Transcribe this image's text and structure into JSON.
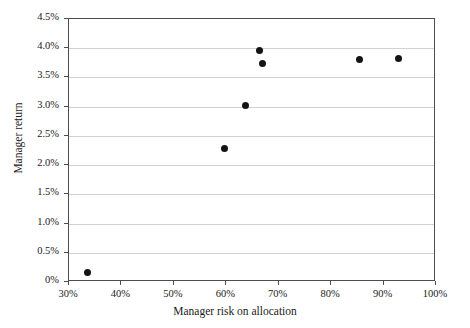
{
  "chart_data": {
    "type": "scatter",
    "title": "",
    "xlabel": "Manager risk on allocation",
    "ylabel": "Manager return",
    "xlim": [
      30,
      100
    ],
    "ylim": [
      0,
      4.5
    ],
    "xticks": [
      30,
      40,
      50,
      60,
      70,
      80,
      90,
      100
    ],
    "xtick_labels": [
      "30%",
      "40%",
      "50%",
      "60%",
      "70%",
      "80%",
      "90%",
      "100%"
    ],
    "yticks": [
      0,
      0.5,
      1.0,
      1.5,
      2.0,
      2.5,
      3.0,
      3.5,
      4.0,
      4.5
    ],
    "ytick_labels": [
      "0%",
      "0.5%",
      "1.0%",
      "1.5%",
      "2.0%",
      "2.5%",
      "3.0%",
      "3.5%",
      "4.0%",
      "4.5%"
    ],
    "grid": "horizontal",
    "legend": "none",
    "marker": {
      "shape": "circle",
      "color": "#141414",
      "size": 7
    },
    "points": [
      {
        "x": 33.6,
        "y": 0.17
      },
      {
        "x": 59.7,
        "y": 2.28
      },
      {
        "x": 63.7,
        "y": 3.02
      },
      {
        "x": 66.4,
        "y": 3.96
      },
      {
        "x": 67.0,
        "y": 3.74
      },
      {
        "x": 85.4,
        "y": 3.81
      },
      {
        "x": 92.8,
        "y": 3.82
      }
    ]
  },
  "style": {
    "axis_color": "#4d4d4d",
    "grid_color": "#d2d2d2",
    "text_color": "#1a1a1a",
    "background": "#ffffff"
  }
}
